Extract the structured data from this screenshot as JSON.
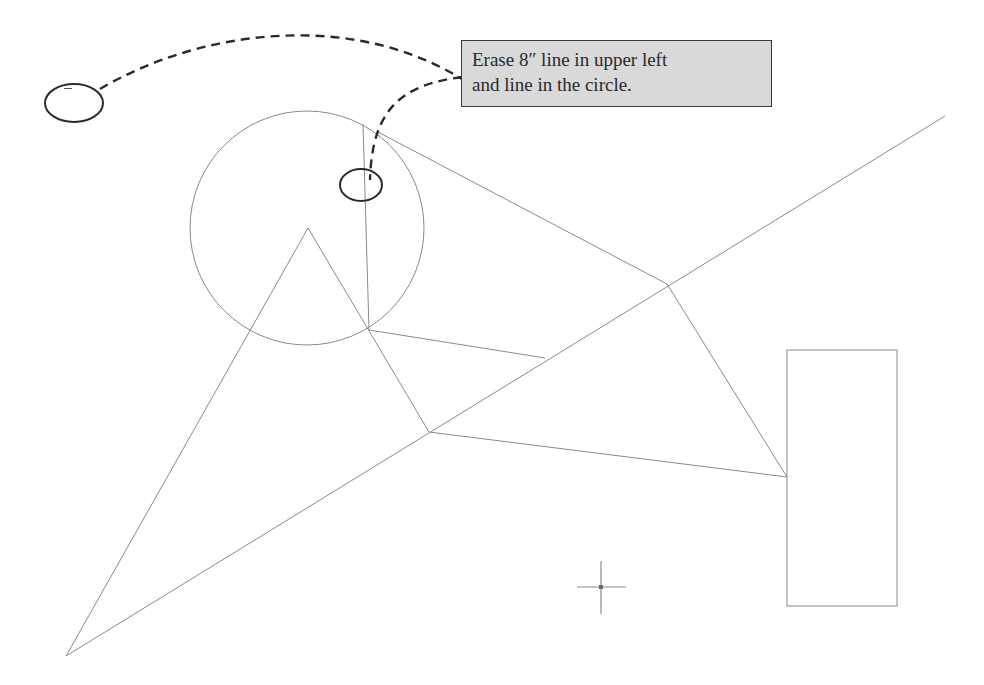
{
  "callout": {
    "line1": "Erase 8″ line in upper left",
    "line2": "and line in the circle.",
    "background": "#d9d9d9",
    "border": "#3a3a3a"
  },
  "annotations": {
    "left_ellipse_label": "–",
    "left_ellipse": {
      "cx": 74,
      "cy": 103,
      "rx": 29,
      "ry": 19
    },
    "circle_ellipse": {
      "cx": 361,
      "cy": 185,
      "rx": 21,
      "ry": 16
    }
  },
  "geometry": {
    "stroke_color": "#8a8a8a",
    "circle": {
      "cx": 307,
      "cy": 228,
      "r": 117
    },
    "triangle": {
      "apex": [
        308,
        228
      ],
      "left_base": [
        66,
        656
      ],
      "right_point": [
        429,
        432
      ]
    },
    "points": {
      "A": [
        369,
        330
      ],
      "B": [
        545,
        358
      ],
      "C": [
        429,
        432
      ],
      "D": [
        667,
        284
      ],
      "E": [
        787,
        477
      ],
      "T": [
        308,
        228
      ],
      "P": [
        66,
        656
      ],
      "far_end": [
        945,
        116
      ],
      "circle_top_line": [
        363,
        124
      ],
      "tangent_top": [
        378,
        132
      ]
    },
    "rectangle": {
      "x": 787,
      "y": 350,
      "width": 110,
      "height": 256
    }
  },
  "cursor": {
    "x": 601,
    "y": 587,
    "icon": "crosshair-icon"
  }
}
